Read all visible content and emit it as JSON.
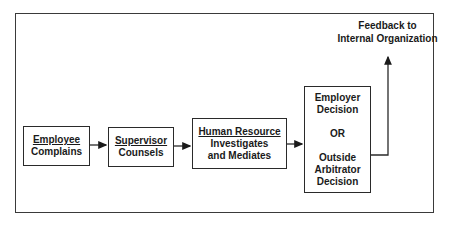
{
  "diagram": {
    "type": "flowchart",
    "direction": "left-to-right",
    "nodes": [
      {
        "id": "employee",
        "title": "Employee",
        "subtitle": "Complains"
      },
      {
        "id": "supervisor",
        "title": "Supervisor",
        "subtitle": "Counsels"
      },
      {
        "id": "hr",
        "title": "Human Resource",
        "line2": "Investigates",
        "line3": "and Mediates"
      },
      {
        "id": "decision",
        "line1": "Employer",
        "line2": "Decision",
        "or": "OR",
        "line3": "Outside",
        "line4": "Arbitrator",
        "line5": "Decision"
      }
    ],
    "feedback": {
      "line1": "Feedback to",
      "line2": "Internal Organization"
    },
    "edges": [
      {
        "from": "employee",
        "to": "supervisor"
      },
      {
        "from": "supervisor",
        "to": "hr"
      },
      {
        "from": "hr",
        "to": "decision"
      },
      {
        "from": "decision",
        "to": "feedback"
      }
    ],
    "colors": {
      "line": "#2a2a2a",
      "background": "#ffffff",
      "text": "#1a1a1a"
    }
  }
}
